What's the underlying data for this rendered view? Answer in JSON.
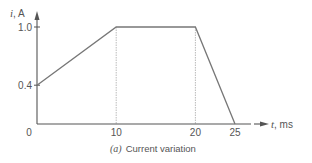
{
  "chart_data": {
    "type": "line",
    "title": "",
    "caption": {
      "prefix": "(a)",
      "text": "Current variation"
    },
    "xlabel": {
      "var": "t",
      "unit": ", ms"
    },
    "ylabel": {
      "var": "i",
      "unit": ", A"
    },
    "xlim": [
      0,
      25
    ],
    "ylim": [
      0,
      1.0
    ],
    "x_ticks": [
      {
        "value": 0,
        "label": "0"
      },
      {
        "value": 10,
        "label": "10"
      },
      {
        "value": 20,
        "label": "20"
      },
      {
        "value": 25,
        "label": "25"
      }
    ],
    "y_ticks": [
      {
        "value": 0.4,
        "label": "0.4"
      },
      {
        "value": 1.0,
        "label": "1.0"
      }
    ],
    "series": [
      {
        "name": "current",
        "x": [
          0,
          10,
          20,
          25
        ],
        "y": [
          0.4,
          1.0,
          1.0,
          0
        ]
      }
    ],
    "guide_lines_x": [
      10,
      20
    ],
    "grid": false,
    "legend": "none",
    "colors": {
      "line": "#777777",
      "axis": "#555555",
      "guide": "#aaaaaa",
      "text": "#555555"
    }
  }
}
